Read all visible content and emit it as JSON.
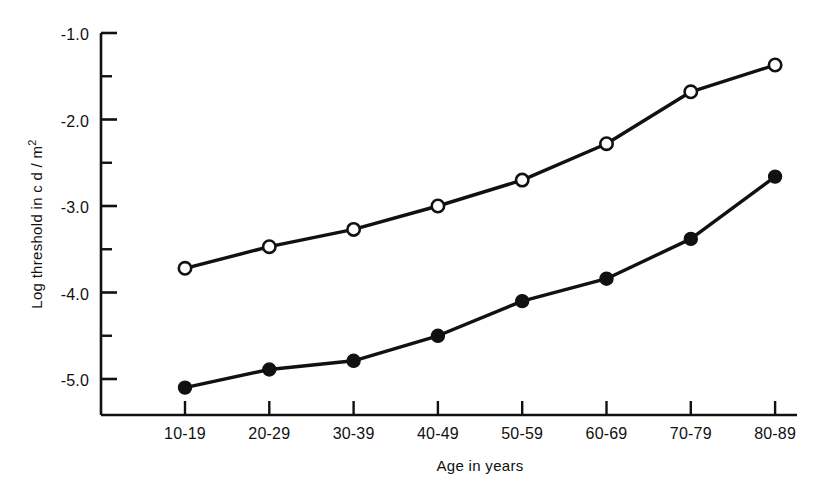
{
  "chart_data": {
    "type": "line",
    "title": "",
    "xlabel": "Age in years",
    "ylabel": "Log threshold in cd/m2",
    "ylabel_parts": {
      "main": "Log threshold in c d / m",
      "sup": "2"
    },
    "categories": [
      "10-19",
      "20-29",
      "30-39",
      "40-49",
      "50-59",
      "60-69",
      "70-79",
      "80-89"
    ],
    "ylim": [
      -5.4,
      -0.85
    ],
    "yticks": [
      -1.0,
      -2.0,
      -3.0,
      -4.0,
      -5.0
    ],
    "ytick_labels": [
      "-1.0",
      "-2.0",
      "-3.0",
      "-4.0",
      "-5.0"
    ],
    "yminor_ticks": [
      -1.5,
      -2.5,
      -3.5,
      -4.5
    ],
    "grid": false,
    "legend": "none",
    "series": [
      {
        "name": "open-circle-series",
        "marker": "open-circle",
        "values": [
          -3.72,
          -3.47,
          -3.27,
          -3.0,
          -2.7,
          -2.28,
          -1.68,
          -1.37
        ]
      },
      {
        "name": "filled-circle-series",
        "marker": "filled-circle",
        "values": [
          -5.1,
          -4.89,
          -4.79,
          -4.5,
          -4.1,
          -3.84,
          -3.38,
          -2.66
        ]
      }
    ]
  },
  "colors": {
    "ink": "#111111",
    "background": "#ffffff"
  }
}
